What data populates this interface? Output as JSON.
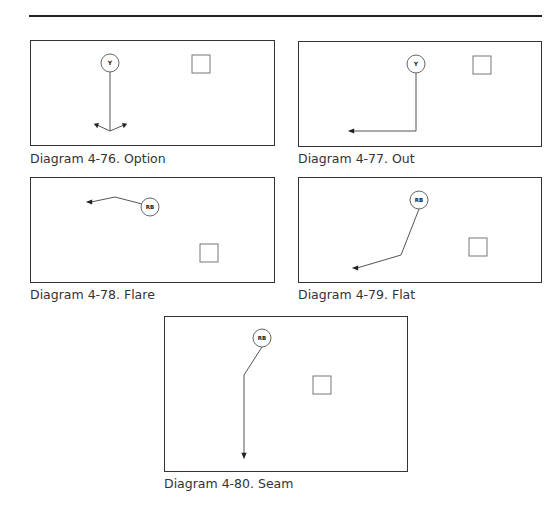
{
  "page": {
    "colors": {
      "line": "#333333",
      "route": "#555555",
      "background": "#ffffff"
    }
  },
  "diagrams": [
    {
      "id": "4-76",
      "caption": "Diagram 4-76. Option",
      "player_label": "Y",
      "route": "option",
      "box": {
        "x": 30,
        "y": 40,
        "w": 245,
        "h": 106
      },
      "player": {
        "cx": 79,
        "cy": 22
      },
      "defender_square": {
        "x": 161,
        "y": 14,
        "size": 18
      },
      "path": "M79,31 L79,90",
      "branches": [
        "M79,90 L66,84",
        "M79,90 L93,84"
      ],
      "arrows": [
        {
          "x": 66,
          "y": 84,
          "dir": "left-up"
        },
        {
          "x": 93,
          "y": 84,
          "dir": "right-up"
        }
      ],
      "caption_pos": {
        "x": 30,
        "y": 151
      }
    },
    {
      "id": "4-77",
      "caption": "Diagram 4-77. Out",
      "player_label": "Y",
      "route": "out",
      "box": {
        "x": 298,
        "y": 41,
        "w": 244,
        "h": 106
      },
      "player": {
        "cx": 117,
        "cy": 22
      },
      "defender_square": {
        "x": 174,
        "y": 14,
        "size": 18
      },
      "path": "M117,31 L117,89 L54,89",
      "arrows": [
        {
          "x": 52,
          "y": 89,
          "dir": "left"
        }
      ],
      "caption_pos": {
        "x": 298,
        "y": 151
      }
    },
    {
      "id": "4-78",
      "caption": "Diagram 4-78. Flare",
      "player_label": "RB",
      "route": "flare",
      "box": {
        "x": 30,
        "y": 177,
        "w": 245,
        "h": 106
      },
      "player": {
        "cx": 119,
        "cy": 29
      },
      "defender_square": {
        "x": 169,
        "y": 66,
        "size": 18
      },
      "path": "M111,26 L84,19 L60,24",
      "arrows": [
        {
          "x": 58,
          "y": 24,
          "dir": "left"
        }
      ],
      "caption_pos": {
        "x": 30,
        "y": 287
      }
    },
    {
      "id": "4-79",
      "caption": "Diagram 4-79. Flat",
      "player_label": "RB",
      "route": "flat",
      "box": {
        "x": 298,
        "y": 177,
        "w": 244,
        "h": 106
      },
      "player": {
        "cx": 120,
        "cy": 22
      },
      "defender_square": {
        "x": 170,
        "y": 60,
        "size": 18
      },
      "path": "M120,31 L102,77 L58,90",
      "arrows": [
        {
          "x": 56,
          "y": 90,
          "dir": "left"
        }
      ],
      "caption_pos": {
        "x": 298,
        "y": 287
      }
    },
    {
      "id": "4-80",
      "caption": "Diagram 4-80. Seam",
      "player_label": "RB",
      "route": "seam",
      "box": {
        "x": 164,
        "y": 316,
        "w": 244,
        "h": 156
      },
      "player": {
        "cx": 97,
        "cy": 21
      },
      "defender_square": {
        "x": 148,
        "y": 59,
        "size": 18
      },
      "path": "M97,30 L79,58 L79,136",
      "arrows": [
        {
          "x": 79,
          "y": 139,
          "dir": "down"
        }
      ],
      "caption_pos": {
        "x": 164,
        "y": 476
      }
    }
  ]
}
